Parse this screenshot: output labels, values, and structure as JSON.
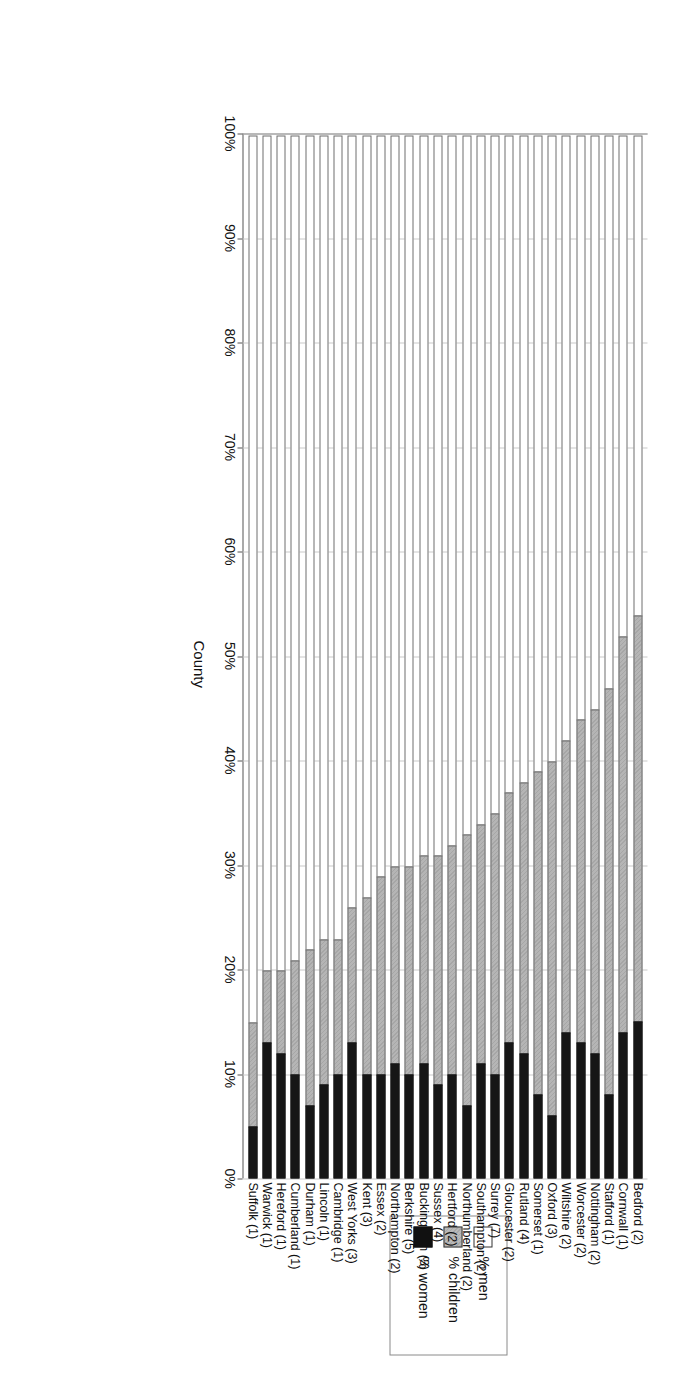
{
  "axes": {
    "category_axis_title": "County",
    "value_ticks": [
      "0%",
      "10%",
      "20%",
      "30%",
      "40%",
      "50%",
      "60%",
      "70%",
      "80%",
      "90%",
      "100%"
    ]
  },
  "legend": {
    "items": [
      {
        "label": "% men",
        "swatch": "white-square-icon",
        "color": "#ffffff"
      },
      {
        "label": "% children",
        "swatch": "hatched-square-icon",
        "color": "#b5b5b5"
      },
      {
        "label": "% women",
        "swatch": "black-square-icon",
        "color": "#161616"
      }
    ]
  },
  "chart_data": {
    "type": "bar",
    "orientation": "horizontal-stacked",
    "title": "",
    "xlabel": "",
    "ylabel": "County",
    "xlim": [
      0,
      100
    ],
    "grid": true,
    "legend_position": "top-right",
    "stacked": true,
    "categories": [
      "Suffolk (1)",
      "Warwick (1)",
      "Hereford (1)",
      "Cumberland (1)",
      "Durham (1)",
      "Lincoln (1)",
      "Cambridge (1)",
      "West Yorks (3)",
      "Kent (3)",
      "Essex (2)",
      "Northampton (2)",
      "Berkshire (5)",
      "Buckingham (3)",
      "Sussex (4)",
      "Hertford (2)",
      "Northumberland (2)",
      "Southampton (2)",
      "Surrey (7)",
      "Gloucester (2)",
      "Rutland (4)",
      "Somerset (1)",
      "Oxford (3)",
      "Wiltshire (2)",
      "Worcester (2)",
      "Nottingham (2)",
      "Stafford (1)",
      "Cornwall (1)",
      "Bedford (2)"
    ],
    "series": [
      {
        "name": "% men",
        "values": [
          85,
          80,
          80,
          79,
          78,
          77,
          77,
          74,
          73,
          71,
          70,
          70,
          69,
          69,
          68,
          67,
          66,
          65,
          63,
          62,
          61,
          60,
          58,
          56,
          55,
          53,
          48,
          46
        ]
      },
      {
        "name": "% children",
        "values": [
          10,
          7,
          8,
          11,
          15,
          14,
          13,
          13,
          17,
          19,
          19,
          20,
          20,
          22,
          22,
          26,
          23,
          25,
          24,
          26,
          31,
          34,
          28,
          31,
          33,
          39,
          38,
          39
        ]
      },
      {
        "name": "% women",
        "values": [
          5,
          13,
          12,
          10,
          7,
          9,
          10,
          13,
          10,
          10,
          11,
          10,
          11,
          9,
          10,
          7,
          11,
          10,
          13,
          12,
          8,
          6,
          14,
          13,
          12,
          8,
          14,
          15
        ]
      }
    ]
  }
}
